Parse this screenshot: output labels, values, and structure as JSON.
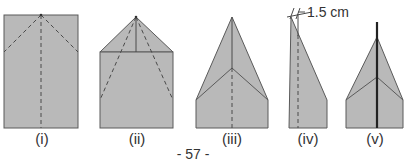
{
  "figure": {
    "steps": [
      {
        "label": "(i)"
      },
      {
        "label": "(ii)"
      },
      {
        "label": "(iii)"
      },
      {
        "label": "(iv)"
      },
      {
        "label": "(v)"
      }
    ],
    "measurement": "1.5 cm",
    "page_number": "- 57 -",
    "colors": {
      "paper": "#b8b8b8",
      "edge": "#555555",
      "fold": "#444444"
    }
  }
}
